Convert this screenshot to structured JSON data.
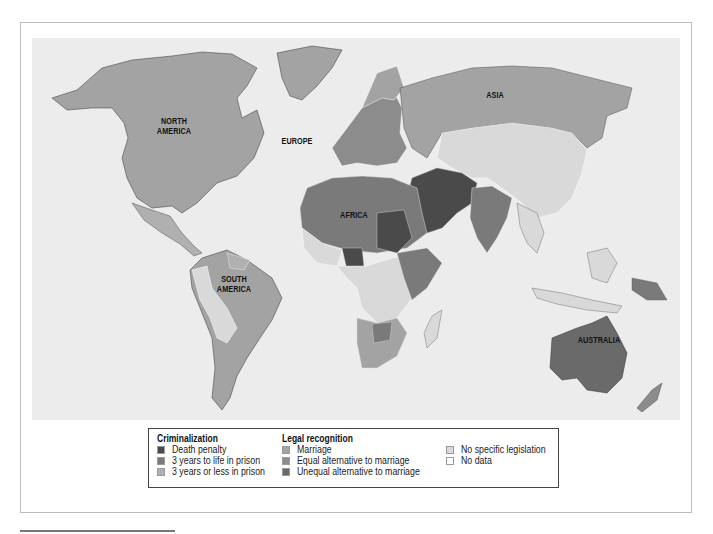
{
  "map": {
    "continent_labels": [
      {
        "id": "north-america",
        "text": "NORTH\nAMERICA",
        "lines": [
          "NORTH",
          "AMERICA"
        ]
      },
      {
        "id": "europe",
        "text": "EUROPE",
        "lines": [
          "EUROPE"
        ]
      },
      {
        "id": "asia",
        "text": "ASIA",
        "lines": [
          "ASIA"
        ]
      },
      {
        "id": "africa",
        "text": "AFRICA",
        "lines": [
          "AFRICA"
        ]
      },
      {
        "id": "south-america",
        "text": "SOUTH\nAMERICA",
        "lines": [
          "SOUTH",
          "AMERICA"
        ]
      },
      {
        "id": "australia",
        "text": "AUSTRALIA",
        "lines": [
          "AUSTRALIA"
        ]
      }
    ],
    "colors": {
      "ocean": "#ececec",
      "death_penalty": "#4a4a4a",
      "three_years_to_life": "#7a7a7a",
      "three_years_or_less": "#b0b0b0",
      "marriage": "#a3a3a3",
      "equal_alternative": "#8c8c8c",
      "unequal_alternative": "#6a6a6a",
      "no_specific_legislation": "#d9d9d9",
      "no_data": "#ffffff"
    }
  },
  "legend": {
    "criminalization": {
      "title": "Criminalization",
      "items": [
        {
          "label": "Death penalty",
          "color": "#4a4a4a"
        },
        {
          "label": "3 years to life in prison",
          "color": "#7a7a7a"
        },
        {
          "label": "3 years or less in prison",
          "color": "#b0b0b0"
        }
      ]
    },
    "legal_recognition": {
      "title": "Legal recognition",
      "items": [
        {
          "label": "Marriage",
          "color": "#a3a3a3"
        },
        {
          "label": "Equal alternative to marriage",
          "color": "#8c8c8c"
        },
        {
          "label": "Unequal alternative to marriage",
          "color": "#6a6a6a"
        }
      ]
    },
    "other": {
      "items": [
        {
          "label": "No specific legislation",
          "color": "#d9d9d9"
        },
        {
          "label": "No data",
          "color": "#ffffff"
        }
      ]
    }
  }
}
